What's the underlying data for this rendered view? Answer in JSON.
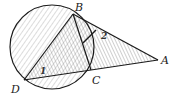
{
  "diagram": {
    "type": "geometry",
    "points": {
      "A": {
        "label": "A",
        "x": 158,
        "y": 60
      },
      "B": {
        "label": "B",
        "x": 73,
        "y": 14
      },
      "C": {
        "label": "C",
        "x": 91,
        "y": 70
      },
      "D": {
        "label": "D",
        "x": 24,
        "y": 80
      }
    },
    "circle": {
      "cx": 52,
      "cy": 47,
      "r": 42
    },
    "angle_labels": {
      "angle1": "1",
      "angle2": "2"
    },
    "colors": {
      "stroke": "#1a1a1a",
      "shade": "#9a9a9a"
    }
  }
}
